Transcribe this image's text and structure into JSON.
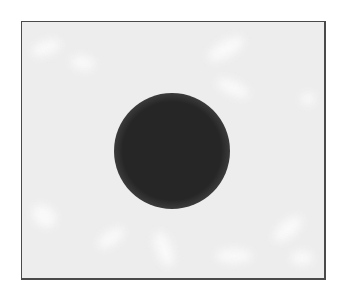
{
  "image": {
    "description": "Dark soft-edged circular spot on a light gray mottled background within a thin dark frame",
    "colors": {
      "background": "#ffffff",
      "field": "#ededed",
      "frame_border": "#4a4a4a",
      "spot_core": "#262626",
      "blotch": "#fbfbfb"
    },
    "frame": {
      "x": 21,
      "y": 21,
      "width": 302,
      "height": 256
    },
    "spot": {
      "cx": 171,
      "cy": 150,
      "core_radius": 42,
      "outer_radius": 58
    },
    "blotches": [
      {
        "x": 30,
        "y": 40,
        "w": 30,
        "h": 14,
        "rot": -20
      },
      {
        "x": 70,
        "y": 55,
        "w": 24,
        "h": 14,
        "rot": 10
      },
      {
        "x": 205,
        "y": 40,
        "w": 40,
        "h": 16,
        "rot": -30
      },
      {
        "x": 215,
        "y": 80,
        "w": 34,
        "h": 14,
        "rot": 25
      },
      {
        "x": 300,
        "y": 92,
        "w": 14,
        "h": 12,
        "rot": 0
      },
      {
        "x": 30,
        "y": 205,
        "w": 26,
        "h": 20,
        "rot": 40
      },
      {
        "x": 95,
        "y": 230,
        "w": 30,
        "h": 14,
        "rot": -35
      },
      {
        "x": 155,
        "y": 230,
        "w": 16,
        "h": 36,
        "rot": -20
      },
      {
        "x": 215,
        "y": 248,
        "w": 36,
        "h": 14,
        "rot": 0
      },
      {
        "x": 270,
        "y": 220,
        "w": 34,
        "h": 16,
        "rot": -40
      },
      {
        "x": 290,
        "y": 250,
        "w": 22,
        "h": 14,
        "rot": 0
      }
    ]
  }
}
